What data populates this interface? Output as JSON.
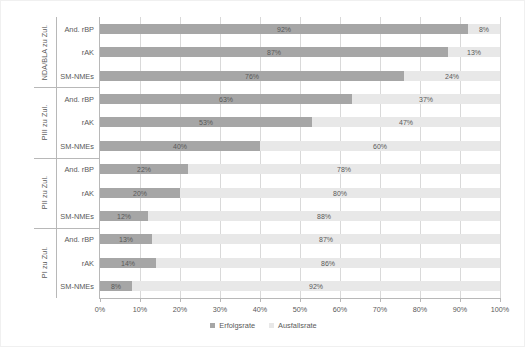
{
  "chart_data": {
    "type": "bar",
    "orientation": "horizontal",
    "stacked": true,
    "normalized_percent": true,
    "title": "",
    "xlabel": "",
    "ylabel": "",
    "xlim": [
      0,
      100
    ],
    "xticks": [
      "0%",
      "10%",
      "20%",
      "30%",
      "40%",
      "50%",
      "60%",
      "70%",
      "80%",
      "90%",
      "100%"
    ],
    "grid": "vertical",
    "legend_position": "bottom-center",
    "series": [
      {
        "name": "Erfolgsrate",
        "color": "#a6a6a6"
      },
      {
        "name": "Ausfallsrate",
        "color": "#e8e8e8"
      }
    ],
    "groups": [
      {
        "label": "NDA/BLA zu Zul.",
        "rows": [
          {
            "category": "And. rBP",
            "success": 92,
            "failure": 8,
            "success_label": "92%",
            "failure_label": "8%"
          },
          {
            "category": "rAK",
            "success": 87,
            "failure": 13,
            "success_label": "87%",
            "failure_label": "13%"
          },
          {
            "category": "SM-NMEs",
            "success": 76,
            "failure": 24,
            "success_label": "76%",
            "failure_label": "24%"
          }
        ]
      },
      {
        "label": "PIII zu Zul.",
        "rows": [
          {
            "category": "And. rBP",
            "success": 63,
            "failure": 37,
            "success_label": "63%",
            "failure_label": "37%"
          },
          {
            "category": "rAK",
            "success": 53,
            "failure": 47,
            "success_label": "53%",
            "failure_label": "47%"
          },
          {
            "category": "SM-NMEs",
            "success": 40,
            "failure": 60,
            "success_label": "40%",
            "failure_label": "60%"
          }
        ]
      },
      {
        "label": "PII zu Zul.",
        "rows": [
          {
            "category": "And. rBP",
            "success": 22,
            "failure": 78,
            "success_label": "22%",
            "failure_label": "78%"
          },
          {
            "category": "rAK",
            "success": 20,
            "failure": 80,
            "success_label": "20%",
            "failure_label": "80%"
          },
          {
            "category": "SM-NMEs",
            "success": 12,
            "failure": 88,
            "success_label": "12%",
            "failure_label": "88%"
          }
        ]
      },
      {
        "label": "PI zu Zul.",
        "rows": [
          {
            "category": "And. rBP",
            "success": 13,
            "failure": 87,
            "success_label": "13%",
            "failure_label": "87%"
          },
          {
            "category": "rAK",
            "success": 14,
            "failure": 86,
            "success_label": "14%",
            "failure_label": "86%"
          },
          {
            "category": "SM-NMEs",
            "success": 8,
            "failure": 92,
            "success_label": "8%",
            "failure_label": "92%"
          }
        ]
      }
    ]
  },
  "legend": {
    "items": [
      {
        "label": "Erfolgsrate",
        "color": "#a6a6a6"
      },
      {
        "label": "Ausfallsrate",
        "color": "#e8e8e8"
      }
    ]
  }
}
